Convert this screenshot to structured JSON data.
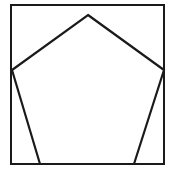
{
  "diagram": {
    "colors": {
      "background": "#ffffff",
      "stroke": "#1a1a1a"
    },
    "square": {
      "x": 11,
      "y": 5,
      "width": 153,
      "height": 159,
      "stroke_width": 2
    },
    "pentagon": {
      "points": [
        [
          88,
          15
        ],
        [
          164,
          70
        ],
        [
          134,
          164
        ],
        [
          40,
          164
        ],
        [
          12,
          70
        ]
      ],
      "stroke_width": 2.2
    }
  }
}
